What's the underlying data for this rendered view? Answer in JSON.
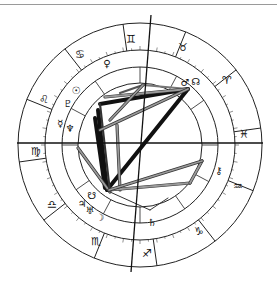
{
  "chart": {
    "title": "",
    "type": "natal-chart-wheel",
    "center": [
      140,
      145
    ],
    "radii": {
      "outer": 122,
      "zodiac_inner": 95,
      "house_inner": 78,
      "aspect_circle": 62
    },
    "axes": {
      "ascendant_line": {
        "from": [
          17,
          143
        ],
        "to": [
          263,
          143
        ]
      },
      "mc_line": {
        "from": [
          151,
          15
        ],
        "to": [
          131,
          272
        ]
      }
    },
    "signs": [
      {
        "name": "Gemini",
        "glyph": "♊",
        "x": 131,
        "y": 39
      },
      {
        "name": "Taurus",
        "glyph": "♉",
        "x": 183,
        "y": 47
      },
      {
        "name": "Aries",
        "glyph": "♈",
        "x": 227,
        "y": 80
      },
      {
        "name": "Pisces",
        "glyph": "♓",
        "x": 244,
        "y": 134
      },
      {
        "name": "Aquarius",
        "glyph": "♒",
        "x": 238,
        "y": 186
      },
      {
        "name": "Capricorn",
        "glyph": "♑",
        "x": 199,
        "y": 231
      },
      {
        "name": "Sagittarius",
        "glyph": "♐",
        "x": 147,
        "y": 253
      },
      {
        "name": "Scorpio",
        "glyph": "♏",
        "x": 96,
        "y": 241
      },
      {
        "name": "Libra",
        "glyph": "♎",
        "x": 52,
        "y": 204
      },
      {
        "name": "Virgo",
        "glyph": "♍",
        "x": 36,
        "y": 151
      },
      {
        "name": "Leo",
        "glyph": "♌",
        "x": 44,
        "y": 99
      },
      {
        "name": "Cancer",
        "glyph": "♋",
        "x": 80,
        "y": 54
      }
    ],
    "planets": [
      {
        "name": "Venus",
        "glyph": "♀",
        "x": 107,
        "y": 63
      },
      {
        "name": "Mars",
        "glyph": "♂",
        "x": 185,
        "y": 82
      },
      {
        "name": "North Node",
        "glyph": "☊",
        "x": 196,
        "y": 81
      },
      {
        "name": "Sun",
        "glyph": "☉",
        "x": 76,
        "y": 90
      },
      {
        "name": "Pluto",
        "glyph": "♇",
        "x": 68,
        "y": 103
      },
      {
        "name": "Mercury",
        "glyph": "☿",
        "x": 60,
        "y": 123
      },
      {
        "name": "Neptune",
        "glyph": "♆",
        "x": 70,
        "y": 128
      },
      {
        "name": "Chiron",
        "glyph": "⚷",
        "x": 219,
        "y": 170
      },
      {
        "name": "Saturn",
        "glyph": "♄",
        "x": 152,
        "y": 222
      },
      {
        "name": "Moon",
        "glyph": "☽",
        "x": 100,
        "y": 217
      },
      {
        "name": "Jupiter",
        "glyph": "♃",
        "x": 82,
        "y": 203
      },
      {
        "name": "Uranus",
        "glyph": "♅",
        "x": 90,
        "y": 210
      },
      {
        "name": "South Node",
        "glyph": "☋",
        "x": 92,
        "y": 195
      }
    ],
    "aspect_lines": [
      {
        "from": [
          100,
          104
        ],
        "to": [
          188,
          89
        ],
        "weight": "heavy",
        "color": "#111111"
      },
      {
        "from": [
          188,
          89
        ],
        "to": [
          107,
          190
        ],
        "weight": "heavy",
        "color": "#111111"
      },
      {
        "from": [
          98,
          110
        ],
        "to": [
          107,
          190
        ],
        "weight": "heavy",
        "color": "#111111"
      },
      {
        "from": [
          95,
          118
        ],
        "to": [
          105,
          188
        ],
        "weight": "heavy",
        "color": "#111111"
      },
      {
        "from": [
          100,
          104
        ],
        "to": [
          110,
          192
        ],
        "weight": "medium",
        "color": "#333333"
      },
      {
        "from": [
          120,
          93
        ],
        "to": [
          143,
          85
        ],
        "weight": "medium",
        "color": "#555555"
      },
      {
        "from": [
          143,
          85
        ],
        "to": [
          188,
          89
        ],
        "weight": "medium",
        "color": "#777777"
      },
      {
        "from": [
          105,
          97
        ],
        "to": [
          188,
          89
        ],
        "weight": "double",
        "color": "#9a9a9a"
      },
      {
        "from": [
          100,
          130
        ],
        "to": [
          188,
          89
        ],
        "weight": "double",
        "color": "#9a9a9a"
      },
      {
        "from": [
          110,
          120
        ],
        "to": [
          143,
          85
        ],
        "weight": "double",
        "color": "#9a9a9a"
      },
      {
        "from": [
          117,
          125
        ],
        "to": [
          120,
          190
        ],
        "weight": "double",
        "color": "#9a9a9a"
      },
      {
        "from": [
          78,
          148
        ],
        "to": [
          110,
          192
        ],
        "weight": "double",
        "color": "#9a9a9a"
      },
      {
        "from": [
          109,
          190
        ],
        "to": [
          190,
          183
        ],
        "weight": "double",
        "color": "#9a9a9a"
      },
      {
        "from": [
          190,
          183
        ],
        "to": [
          202,
          161
        ],
        "weight": "double",
        "color": "#9a9a9a"
      },
      {
        "from": [
          109,
          190
        ],
        "to": [
          202,
          161
        ],
        "weight": "double",
        "color": "#9a9a9a"
      },
      {
        "from": [
          110,
          192
        ],
        "to": [
          150,
          210
        ],
        "weight": "thin",
        "color": "#333333"
      },
      {
        "from": [
          150,
          210
        ],
        "to": [
          168,
          198
        ],
        "weight": "thin",
        "color": "#333333"
      }
    ]
  }
}
